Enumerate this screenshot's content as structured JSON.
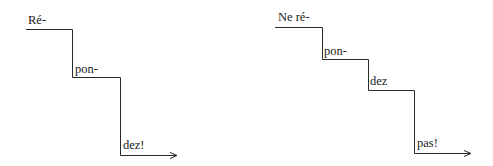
{
  "colors": {
    "background": "#ffffff",
    "line": "#2a2a2a",
    "text": "#1a1a1a"
  },
  "diagrams": [
    {
      "name": "affirmative-staircase",
      "steps": [
        {
          "label": "Ré-",
          "x1": 26,
          "x2": 72,
          "y": 29
        },
        {
          "label": "pon-",
          "x1": 72,
          "x2": 120,
          "y": 77
        },
        {
          "label": "dez!",
          "x1": 120,
          "x2": 177,
          "y": 155
        }
      ],
      "arrow": true
    },
    {
      "name": "negative-staircase",
      "steps": [
        {
          "label": "Ne ré-",
          "x1": 275,
          "x2": 322,
          "y": 27
        },
        {
          "label": "pon-",
          "x1": 322,
          "x2": 368,
          "y": 59
        },
        {
          "label": "dez",
          "x1": 368,
          "x2": 414,
          "y": 90
        },
        {
          "label": "pas!",
          "x1": 414,
          "x2": 471,
          "y": 153
        }
      ],
      "arrow": true
    }
  ]
}
